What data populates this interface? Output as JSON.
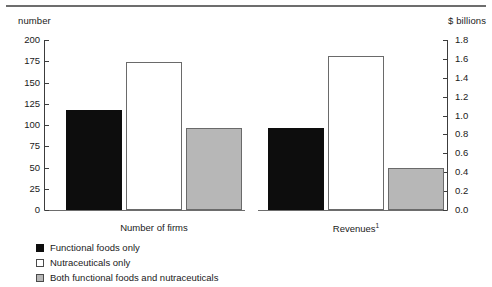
{
  "chart_data": {
    "type": "bar",
    "title": "",
    "categories": [
      "Number of firms",
      "Revenues¹"
    ],
    "series": [
      {
        "name": "Functional foods only",
        "color": "#0d0d0d",
        "values": [
          118,
          0.87
        ]
      },
      {
        "name": "Nutraceuticals only",
        "color": "#ffffff",
        "values": [
          174,
          1.63
        ]
      },
      {
        "name": "Both functional foods and nutraceuticals",
        "color": "#b7b7b7",
        "values": [
          97,
          0.44
        ]
      }
    ],
    "left_axis": {
      "label": "number",
      "ticks": [
        "0",
        "25",
        "50",
        "75",
        "100",
        "125",
        "150",
        "175",
        "200"
      ],
      "values": [
        0,
        25,
        50,
        75,
        100,
        125,
        150,
        175,
        200
      ],
      "ylim": [
        0,
        200
      ],
      "applies_to": "Number of firms"
    },
    "right_axis": {
      "label": "$ billions",
      "ticks": [
        "0.0",
        "0.2",
        "0.4",
        "0.6",
        "0.8",
        "1.0",
        "1.2",
        "1.4",
        "1.6",
        "1.8"
      ],
      "values": [
        0.0,
        0.2,
        0.4,
        0.6,
        0.8,
        1.0,
        1.2,
        1.4,
        1.6,
        1.8
      ],
      "ylim": [
        0,
        1.8
      ],
      "applies_to": "Revenues¹"
    },
    "xlabel": "",
    "ylabel": "number",
    "grid": false,
    "legend_position": "bottom-left"
  },
  "axes": {
    "left_caption": "number",
    "right_caption": "$ billions"
  },
  "groups": [
    {
      "label": "Number of firms",
      "footnote": ""
    },
    {
      "label": "Revenues",
      "footnote": "1"
    }
  ],
  "legend": {
    "items": [
      {
        "label": "Functional foods only",
        "swatch": "black"
      },
      {
        "label": "Nutraceuticals only",
        "swatch": "white"
      },
      {
        "label": "Both functional foods and nutraceuticals",
        "swatch": "gray"
      }
    ]
  }
}
